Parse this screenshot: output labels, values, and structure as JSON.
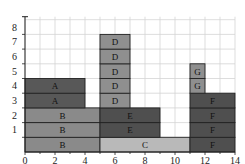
{
  "chart_data": {
    "type": "bar",
    "subtype": "stacked-block-schedule",
    "xlabel": "",
    "ylabel": "",
    "xlim": [
      0,
      14
    ],
    "ylim": [
      0,
      9
    ],
    "x_ticks": [
      0,
      2,
      4,
      6,
      8,
      10,
      12,
      14
    ],
    "y_ticks": [
      1,
      2,
      3,
      4,
      5,
      6,
      7,
      8
    ],
    "grid": true,
    "blocks": [
      {
        "label": "B",
        "x0": 0,
        "x1": 5,
        "row": 1,
        "color": "#8a8a8a"
      },
      {
        "label": "B",
        "x0": 0,
        "x1": 5,
        "row": 2,
        "color": "#8a8a8a"
      },
      {
        "label": "B",
        "x0": 0,
        "x1": 5,
        "row": 3,
        "color": "#8a8a8a"
      },
      {
        "label": "A",
        "x0": 0,
        "x1": 4,
        "row": 4,
        "color": "#585858"
      },
      {
        "label": "A",
        "x0": 0,
        "x1": 4,
        "row": 5,
        "color": "#585858"
      },
      {
        "label": "C",
        "x0": 5,
        "x1": 11,
        "row": 1,
        "color": "#b9b9b9"
      },
      {
        "label": "E",
        "x0": 5,
        "x1": 9,
        "row": 2,
        "color": "#4f4f4f"
      },
      {
        "label": "E",
        "x0": 5,
        "x1": 9,
        "row": 3,
        "color": "#4f4f4f"
      },
      {
        "label": "D",
        "x0": 5,
        "x1": 7,
        "row": 4,
        "color": "#8f8f8f"
      },
      {
        "label": "D",
        "x0": 5,
        "x1": 7,
        "row": 5,
        "color": "#8f8f8f"
      },
      {
        "label": "D",
        "x0": 5,
        "x1": 7,
        "row": 6,
        "color": "#8f8f8f"
      },
      {
        "label": "D",
        "x0": 5,
        "x1": 7,
        "row": 7,
        "color": "#8f8f8f"
      },
      {
        "label": "D",
        "x0": 5,
        "x1": 7,
        "row": 8,
        "color": "#8f8f8f"
      },
      {
        "label": "F",
        "x0": 11,
        "x1": 14,
        "row": 1,
        "color": "#4f4f4f"
      },
      {
        "label": "F",
        "x0": 11,
        "x1": 14,
        "row": 2,
        "color": "#4f4f4f"
      },
      {
        "label": "F",
        "x0": 11,
        "x1": 14,
        "row": 3,
        "color": "#4f4f4f"
      },
      {
        "label": "F",
        "x0": 11,
        "x1": 14,
        "row": 4,
        "color": "#4f4f4f"
      },
      {
        "label": "G",
        "x0": 11,
        "x1": 12,
        "row": 5,
        "color": "#8f8f8f"
      },
      {
        "label": "G",
        "x0": 11,
        "x1": 12,
        "row": 6,
        "color": "#8f8f8f"
      }
    ]
  }
}
